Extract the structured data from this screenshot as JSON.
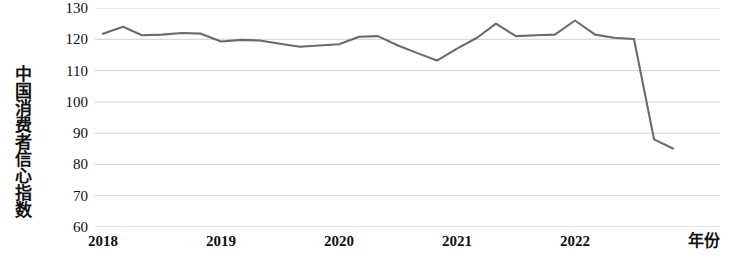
{
  "chart_data": {
    "type": "line",
    "title": "",
    "subtitle": "",
    "ylabel": "中国消费者信心指数",
    "xlabel": "年份",
    "ylim": [
      60,
      130
    ],
    "ytick_labels": [
      "130",
      "120",
      "110",
      "100",
      "90",
      "80",
      "70",
      "60"
    ],
    "ytick_values": [
      130,
      120,
      110,
      100,
      90,
      80,
      70,
      60
    ],
    "xtick_labels": [
      "2018",
      "2019",
      "2020",
      "2021",
      "2022"
    ],
    "xtick_values": [
      2018,
      2019,
      2020,
      2021,
      2022
    ],
    "grid": true,
    "grid_axis": "y",
    "legend": false,
    "legend_position": "none",
    "line_color": "#6b6b6b",
    "grid_color": "#c9c9c9",
    "series": [
      {
        "name": "中国消费者信心指数",
        "x": [
          2018.0,
          2018.17,
          2018.33,
          2018.5,
          2018.67,
          2018.83,
          2019.0,
          2019.17,
          2019.33,
          2019.5,
          2019.67,
          2019.83,
          2020.0,
          2020.17,
          2020.33,
          2020.5,
          2020.67,
          2020.83,
          2021.0,
          2021.17,
          2021.33,
          2021.5,
          2021.67,
          2021.83,
          2022.0,
          2022.17,
          2022.33,
          2022.5,
          2022.67,
          2022.83
        ],
        "values": [
          121.8,
          124.0,
          121.3,
          121.5,
          122.0,
          121.8,
          119.3,
          119.8,
          119.6,
          118.6,
          117.6,
          118.0,
          118.4,
          120.8,
          121.0,
          118.0,
          115.5,
          113.2,
          117.0,
          120.5,
          125.0,
          121.0,
          121.3,
          121.5,
          126.0,
          121.5,
          120.5,
          120.1,
          88.0,
          85.1
        ]
      }
    ],
    "annotations": [
      {
        "label": "2022年3月后大幅下跌",
        "visible": false
      }
    ]
  },
  "axis": {
    "y_title": "中国消费者信心指数",
    "x_title": "年份"
  }
}
